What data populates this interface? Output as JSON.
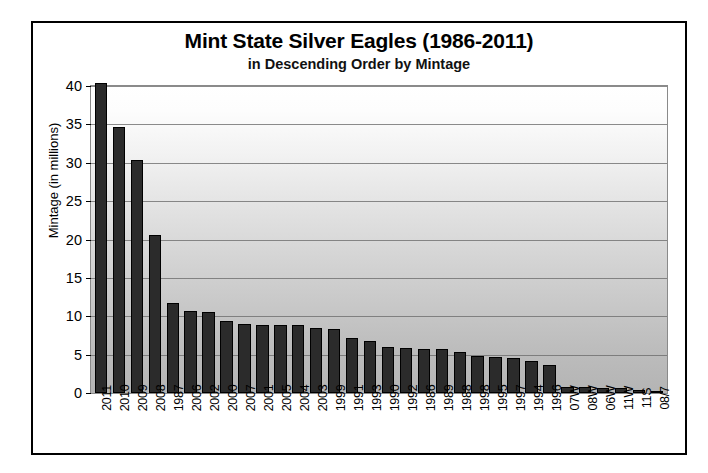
{
  "chart_data": {
    "type": "bar",
    "title": "Mint State Silver Eagles (1986-2011)",
    "subtitle": "in Descending Order by Mintage",
    "xlabel": "",
    "ylabel": "Mintage (in millions)",
    "ylim": [
      0,
      40
    ],
    "yticks": [
      0,
      5,
      10,
      15,
      20,
      25,
      30,
      35,
      40
    ],
    "ytick_labels": [
      "0",
      "5",
      "10",
      "15",
      "20",
      "25",
      "30",
      "35",
      "40"
    ],
    "grid": true,
    "legend": "none",
    "bar_color": "#2b2b2b",
    "categories": [
      "2011",
      "2010",
      "2009",
      "2008",
      "1987",
      "2006",
      "2002",
      "2000",
      "2007",
      "2001",
      "2005",
      "2004",
      "2003",
      "1999",
      "1991",
      "1993",
      "1990",
      "1992",
      "1986",
      "1989",
      "1988",
      "1998",
      "1995",
      "1997",
      "1994",
      "1996",
      "07W",
      "08W",
      "06W",
      "11W",
      "11S",
      "08/7"
    ],
    "values": [
      40.4,
      34.7,
      30.4,
      20.6,
      11.7,
      10.7,
      10.5,
      9.4,
      9.0,
      8.8,
      8.9,
      8.8,
      8.5,
      8.4,
      7.2,
      6.8,
      6.0,
      5.9,
      5.8,
      5.7,
      5.4,
      4.8,
      4.7,
      4.5,
      4.2,
      3.6,
      0.82,
      0.8,
      0.69,
      0.66,
      0.4,
      0.05
    ],
    "ytick_positions_pct": [
      0,
      12.5,
      25,
      37.5,
      50,
      62.5,
      75,
      87.5,
      100
    ]
  }
}
